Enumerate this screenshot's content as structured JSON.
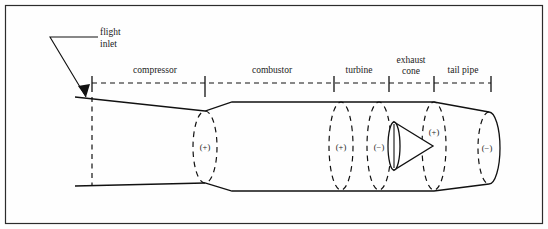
{
  "figure": {
    "border_color": "#2c2c2c",
    "line_color": "#111111",
    "background": "#fefefe"
  },
  "callout": {
    "line1": "flight",
    "line2": "inlet",
    "arrow_name": "flight-inlet-arrow"
  },
  "stations": [
    {
      "id": "compressor",
      "label": "compressor",
      "label_x": 155,
      "label_y": 73
    },
    {
      "id": "combustor",
      "label": "combustor",
      "label_x": 272,
      "label_y": 73
    },
    {
      "id": "turbine",
      "label": "turbine",
      "label_x": 359,
      "label_y": 73
    },
    {
      "id": "exhaust-cone",
      "label_line1": "exhaust",
      "label_line2": "cone",
      "label_x": 411,
      "label_y": 63
    },
    {
      "id": "tail-pipe",
      "label": "tail pipe",
      "label_x": 463,
      "label_y": 73
    }
  ],
  "station_ticks_x": [
    92,
    205,
    334,
    389,
    434,
    491
  ],
  "centerline": {
    "y": 83,
    "x_start": 92,
    "x_end": 491
  },
  "sign_markers": [
    {
      "id": "compressor-exit",
      "sign": "(+)",
      "x": 205,
      "y": 147
    },
    {
      "id": "combustor-exit",
      "sign": "(+)",
      "x": 341,
      "y": 147
    },
    {
      "id": "turbine-exit",
      "sign": "(−)",
      "x": 379,
      "y": 147
    },
    {
      "id": "cone-exit",
      "sign": "(+)",
      "x": 434,
      "y": 132
    },
    {
      "id": "nozzle-exit",
      "sign": "(−)",
      "x": 487,
      "y": 148
    }
  ],
  "ellipses": [
    {
      "id": "compressor-exit-ellipse",
      "cx": 205,
      "cy": 147,
      "rx": 12,
      "ry": 36,
      "style": "dashed"
    },
    {
      "id": "combustor-exit-ellipse",
      "cx": 341,
      "cy": 146,
      "rx": 12,
      "ry": 44,
      "style": "dashed"
    },
    {
      "id": "turbine-exit-ellipse",
      "cx": 379,
      "cy": 146,
      "rx": 12,
      "ry": 44,
      "style": "dashed"
    },
    {
      "id": "cone-exit-ellipse",
      "cx": 434,
      "cy": 146,
      "rx": 12,
      "ry": 44,
      "style": "dashed"
    },
    {
      "id": "nozzle-exit-ellipse",
      "cx": 489,
      "cy": 148,
      "rx": 11,
      "ry": 36,
      "style": "half-solid"
    },
    {
      "id": "cone-base-ellipse",
      "cx": 394,
      "cy": 146,
      "rx": 6,
      "ry": 24,
      "style": "solid"
    }
  ],
  "cone": {
    "id": "exhaust-cone-triangle",
    "apex_x": 433,
    "apex_y": 146,
    "base_x": 394,
    "base_top_y": 122,
    "base_bottom_y": 170
  }
}
